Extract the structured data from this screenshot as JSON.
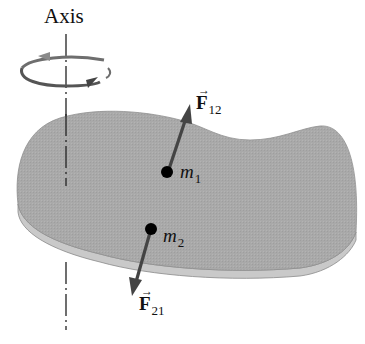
{
  "figure": {
    "axis_label": "Axis",
    "rotation_icon": "circular-rotation-arrow-icon",
    "body": "rigid-slab",
    "masses": [
      {
        "id": "m1",
        "symbol": "m",
        "subscript": "1"
      },
      {
        "id": "m2",
        "symbol": "m",
        "subscript": "2"
      }
    ],
    "forces": [
      {
        "id": "F12",
        "symbol": "F",
        "subscript": "12",
        "vector_mark": "→",
        "direction": "up-right",
        "acts_on": "m1"
      },
      {
        "id": "F21",
        "symbol": "F",
        "subscript": "21",
        "vector_mark": "→",
        "direction": "down-left",
        "acts_on": "m2"
      }
    ]
  },
  "colors": {
    "slab_top": "#a9a9a9",
    "slab_edge": "#c9c9c9",
    "slab_rim": "#8a8a8a",
    "arrow": "#444444",
    "mass_dot": "#000000",
    "rotation_arrow": "#6e6e6e",
    "axis_line": "#222222"
  }
}
